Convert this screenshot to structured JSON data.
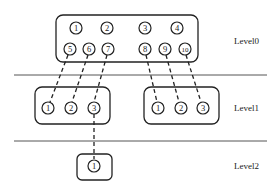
{
  "levels": [
    {
      "label": "Level0",
      "nodes": [
        "1",
        "2",
        "3",
        "4",
        "5",
        "6",
        "7",
        "8",
        "9",
        "10"
      ]
    },
    {
      "label": "Level1",
      "groups": [
        {
          "nodes": [
            "1",
            "2",
            "3"
          ]
        },
        {
          "nodes": [
            "1",
            "2",
            "3"
          ]
        }
      ]
    },
    {
      "label": "Level2",
      "nodes": [
        "1"
      ]
    }
  ],
  "colors": {
    "stroke": "#222222",
    "background": "#ffffff",
    "separator": "#555555"
  }
}
